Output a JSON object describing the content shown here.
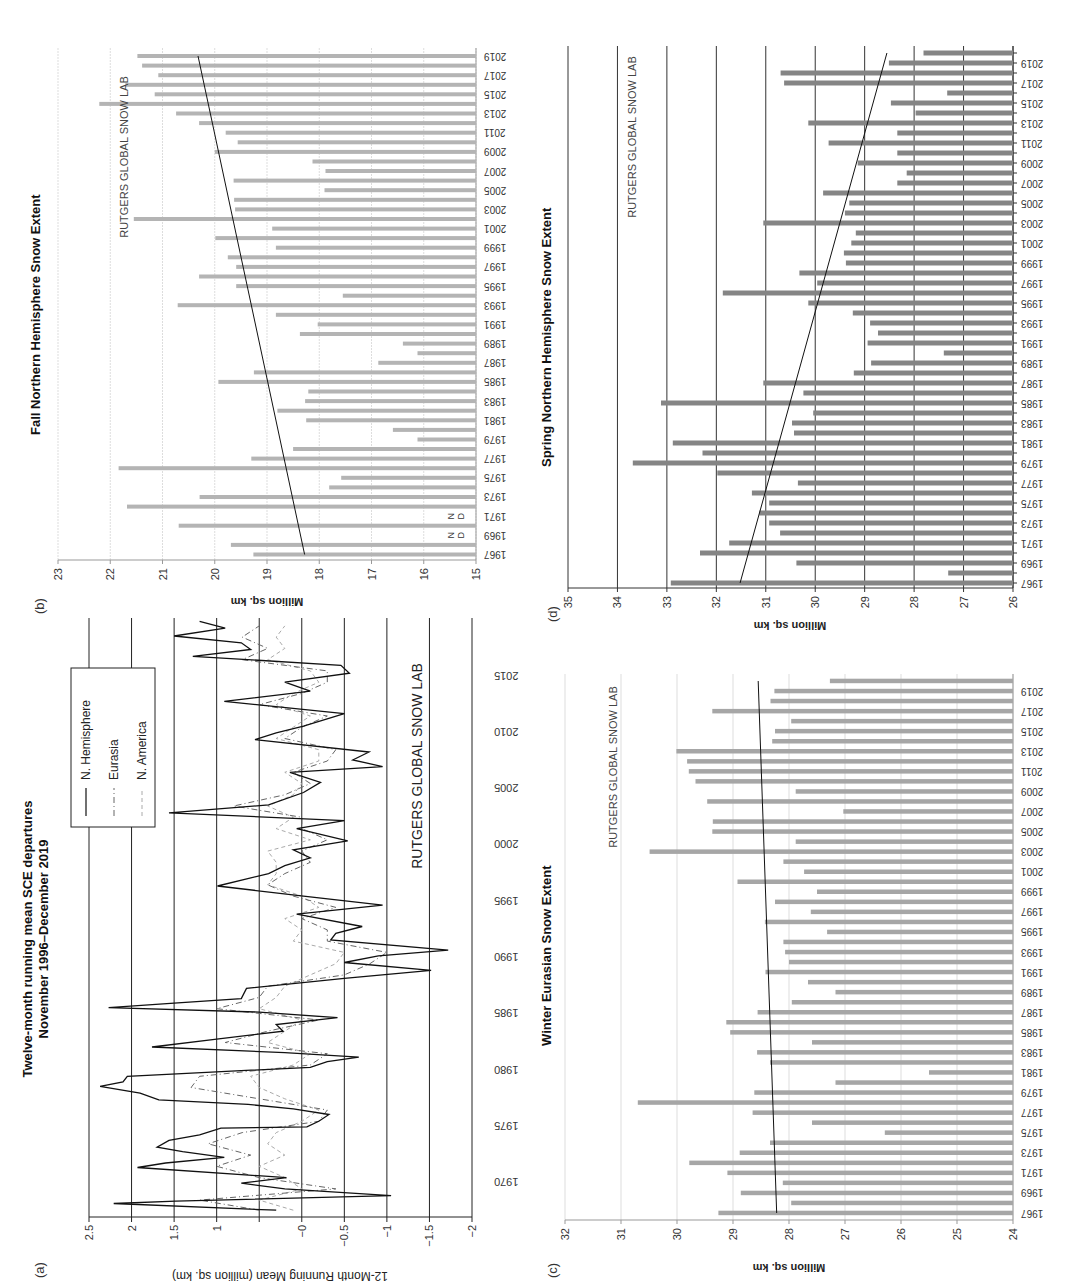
{
  "figure": {
    "panel_labels": {
      "a": "(a)",
      "b": "(b)",
      "c": "(c)",
      "d": "(d)"
    },
    "watermark": "RUTGERS GLOBAL SNOW LAB",
    "colors": {
      "fall_bar": "#b4b4b4",
      "spring_bar": "#858585",
      "winter_bar": "#a6a6a6",
      "grid_light": "#dddddd",
      "grid_dark": "#333333",
      "nh_line": "#111111",
      "eurasia_line": "#666666",
      "namerica_line": "#aaaaaa"
    }
  },
  "chart_data": [
    {
      "id": "a",
      "type": "line",
      "title": "Twelve-month running mean SCE departures",
      "subtitle": "November 1996–December 2019",
      "xlabel": "",
      "ylabel": "12-Month Running Mean (million sq. km)",
      "ylim": [
        -2,
        2.5
      ],
      "xlim": [
        1967,
        2020
      ],
      "yticks": [
        2.5,
        2,
        1.5,
        1,
        0.5,
        0,
        -0.5,
        -1,
        -1.5,
        -2
      ],
      "ytick_labels": [
        "2.5",
        "2",
        "1.5",
        "1",
        "",
        "−0",
        "−0.5",
        "−1",
        "−1.5",
        "−2"
      ],
      "xticks": [
        1970,
        1975,
        1980,
        1985,
        1990,
        1995,
        2000,
        2005,
        2010,
        2015
      ],
      "xtick_labels": [
        "1970",
        "1975",
        "1980",
        "1985",
        "1990",
        "1995",
        "2000",
        "2005",
        "2010",
        "2015"
      ],
      "grid": true,
      "legend": [
        "N. Hemisphere",
        "Eurasia",
        "N. America"
      ],
      "legend_position": "upper right",
      "annotation": "RUTGERS GLOBAL SNOW LAB",
      "series": [
        {
          "name": "N. Hemisphere",
          "style": "solid",
          "x": [
            1967.6,
            1968.2,
            1968.4,
            1968.9,
            1969.5,
            1970.0,
            1970.5,
            1971.4,
            1971.8,
            1972.3,
            1972.8,
            1973.2,
            1973.8,
            1974.3,
            1974.9,
            1975.0,
            1975.5,
            1976.1,
            1976.6,
            1977.0,
            1977.4,
            1978.0,
            1978.6,
            1979.0,
            1979.5,
            1980.3,
            1980.8,
            1981.2,
            1981.6,
            1982.1,
            1982.8,
            1983.5,
            1984.1,
            1984.7,
            1985.2,
            1985.6,
            1986.0,
            1986.4,
            1987.3,
            1988.2,
            1988.9,
            1989.6,
            1990.2,
            1990.7,
            1991.6,
            1992.2,
            1992.8,
            1993.9,
            1994.7,
            1995.5,
            1996.4,
            1997.5,
            1998.2,
            1998.9,
            1999.6,
            2000.4,
            2001.5,
            2002.2,
            2002.9,
            2003.6,
            2004.7,
            2005.6,
            2006.5,
            2007.0,
            2007.6,
            2008.3,
            2009.4,
            2010.0,
            2010.6,
            2011.7,
            2012.8,
            2013.7,
            2014.5,
            2015.3,
            2016.0,
            2016.8,
            2017.4,
            2018.0,
            2018.6,
            2019.3,
            2019.9
          ],
          "y": [
            0.3,
            2.21,
            1.48,
            -1.05,
            0.2,
            0.71,
            0.18,
            1.93,
            1.6,
            0.91,
            1.4,
            1.7,
            1.56,
            1.2,
            0.95,
            -0.06,
            -0.2,
            -0.32,
            0.1,
            0.63,
            1.68,
            1.9,
            2.37,
            2.1,
            2.05,
            -0.1,
            -0.3,
            -0.67,
            0.2,
            1.76,
            1.0,
            0.22,
            0.3,
            -0.42,
            0.5,
            2.27,
            1.5,
            0.71,
            0.65,
            -0.5,
            -1.52,
            -0.5,
            -0.9,
            -1.72,
            -0.34,
            -0.4,
            -0.71,
            0.06,
            -0.95,
            -0.02,
            0.99,
            0.39,
            0.2,
            -0.1,
            0.1,
            -0.54,
            0.06,
            -0.5,
            1.56,
            0.39,
            -0.02,
            -0.22,
            0.14,
            -0.95,
            -0.6,
            -0.79,
            0.55,
            0.3,
            -0.02,
            -0.5,
            0.91,
            -0.1,
            0.2,
            -0.56,
            -0.46,
            1.28,
            0.6,
            0.71,
            1.5,
            0.9,
            1.2
          ]
        },
        {
          "name": "Eurasia",
          "style": "dash-dot",
          "x": [
            1967.6,
            1968.5,
            1969.5,
            1970.5,
            1971.5,
            1972.5,
            1973.5,
            1974.5,
            1975.5,
            1976.5,
            1977.5,
            1978.5,
            1979.5,
            1980.5,
            1981.5,
            1982.5,
            1983.5,
            1984.5,
            1985.5,
            1986.5,
            1987.5,
            1988.5,
            1989.5,
            1990.5,
            1991.5,
            1992.5,
            1993.5,
            1994.5,
            1995.5,
            1996.5,
            1997.5,
            1998.5,
            1999.5,
            2000.5,
            2001.5,
            2002.5,
            2003.5,
            2004.5,
            2005.5,
            2006.5,
            2007.5,
            2008.5,
            2009.5,
            2010.5,
            2011.5,
            2012.5,
            2013.5,
            2014.5,
            2015.5,
            2016.5,
            2017.5,
            2018.5,
            2019.5
          ],
          "y": [
            0.5,
            1.2,
            -0.4,
            0.5,
            1.0,
            0.6,
            1.1,
            0.7,
            -0.2,
            -0.3,
            0.5,
            1.3,
            1.2,
            -0.1,
            -0.3,
            0.9,
            0.4,
            -0.2,
            1.0,
            0.5,
            0.4,
            -0.5,
            -0.8,
            -1.0,
            -0.3,
            -0.3,
            0.0,
            -0.4,
            0.1,
            0.4,
            0.2,
            -0.1,
            0.0,
            -0.3,
            0.0,
            0.0,
            0.8,
            0.2,
            -0.1,
            0.1,
            -0.3,
            -0.4,
            0.2,
            0.0,
            -0.3,
            0.5,
            0.0,
            -0.3,
            -0.3,
            0.7,
            0.4,
            0.7,
            0.5
          ]
        },
        {
          "name": "N. America",
          "style": "dashed",
          "x": [
            1967.6,
            1968.5,
            1969.5,
            1970.5,
            1971.5,
            1972.5,
            1973.5,
            1974.5,
            1975.5,
            1976.5,
            1977.5,
            1978.5,
            1979.5,
            1980.5,
            1981.5,
            1982.5,
            1983.5,
            1984.5,
            1985.5,
            1986.5,
            1987.5,
            1988.5,
            1989.5,
            1990.5,
            1991.5,
            1992.5,
            1993.5,
            1994.5,
            1995.5,
            1996.5,
            1997.5,
            1998.5,
            1999.5,
            2000.5,
            2001.5,
            2002.5,
            2003.5,
            2004.5,
            2005.5,
            2006.5,
            2007.5,
            2008.5,
            2009.5,
            2010.5,
            2011.5,
            2012.5,
            2013.5,
            2014.5,
            2015.5,
            2016.5,
            2017.5,
            2018.5,
            2019.5
          ],
          "y": [
            0.1,
            0.5,
            0.0,
            0.2,
            0.5,
            0.2,
            0.4,
            0.3,
            0.0,
            -0.2,
            0.2,
            0.5,
            0.6,
            0.1,
            -0.1,
            0.4,
            0.2,
            0.0,
            0.5,
            0.3,
            0.2,
            -0.1,
            -0.4,
            -0.5,
            0.1,
            0.0,
            0.2,
            -0.2,
            0.0,
            0.4,
            0.3,
            0.3,
            0.4,
            -0.1,
            0.3,
            0.1,
            0.4,
            0.1,
            0.0,
            0.2,
            -0.2,
            -0.2,
            0.3,
            0.1,
            -0.1,
            0.3,
            0.1,
            -0.2,
            -0.1,
            0.4,
            0.2,
            0.3,
            0.2
          ]
        }
      ]
    },
    {
      "id": "b",
      "type": "bar",
      "title": "Fall Northern Hemisphere Snow Extent",
      "xlabel": "",
      "ylabel": "Million sq. km",
      "ylim": [
        15,
        23
      ],
      "yticks": [
        23,
        22,
        21,
        20,
        19,
        18,
        17,
        16,
        15
      ],
      "grid": true,
      "annotation": "RUTGERS GLOBAL SNOW LAB",
      "missing_label": [
        "N",
        "D"
      ],
      "missing_years": [
        1969,
        1971
      ],
      "categories": [
        1967,
        1968,
        1969,
        1970,
        1971,
        1972,
        1973,
        1974,
        1975,
        1976,
        1977,
        1978,
        1979,
        1980,
        1981,
        1982,
        1983,
        1984,
        1985,
        1986,
        1987,
        1988,
        1989,
        1990,
        1991,
        1992,
        1993,
        1994,
        1995,
        1996,
        1997,
        1998,
        1999,
        2000,
        2001,
        2002,
        2003,
        2004,
        2005,
        2006,
        2007,
        2008,
        2009,
        2010,
        2011,
        2012,
        2013,
        2014,
        2015,
        2016,
        2017,
        2018,
        2019
      ],
      "xtick_labels": [
        "1967",
        "1969",
        "1971",
        "1973",
        "1975",
        "1977",
        "1979",
        "1981",
        "1983",
        "1985",
        "1987",
        "1989",
        "1991",
        "1993",
        "1995",
        "1997",
        "1999",
        "2001",
        "2003",
        "2005",
        "2007",
        "2009",
        "2011",
        "2013",
        "2015",
        "2017",
        "2019"
      ],
      "values": [
        19.26,
        19.69,
        null,
        20.69,
        null,
        21.68,
        20.29,
        17.81,
        17.58,
        21.84,
        19.3,
        18.5,
        16.12,
        16.59,
        18.25,
        18.8,
        18.27,
        18.21,
        19.93,
        19.25,
        16.87,
        16.12,
        16.4,
        18.37,
        18.03,
        18.83,
        20.71,
        17.55,
        19.59,
        20.3,
        19.59,
        19.75,
        18.83,
        19.99,
        18.9,
        21.55,
        19.61,
        19.63,
        17.9,
        19.64,
        17.88,
        18.13,
        20.0,
        19.56,
        19.79,
        20.3,
        20.74,
        22.21,
        21.15,
        21.71,
        21.08,
        21.39,
        21.48
      ],
      "trend": {
        "start": [
          1967,
          18.28
        ],
        "end": [
          2019,
          20.32
        ]
      }
    },
    {
      "id": "c",
      "type": "bar",
      "title": "Winter Eurasian Snow Extent",
      "xlabel": "",
      "ylabel": "Million sq. km",
      "ylim": [
        24,
        32
      ],
      "yticks": [
        32,
        31,
        30,
        29,
        28,
        27,
        26,
        25,
        24
      ],
      "grid": true,
      "annotation": "RUTGERS GLOBAL SNOW LAB",
      "categories": [
        1967,
        1968,
        1969,
        1970,
        1971,
        1972,
        1973,
        1974,
        1975,
        1976,
        1977,
        1978,
        1979,
        1980,
        1981,
        1982,
        1983,
        1984,
        1985,
        1986,
        1987,
        1988,
        1989,
        1990,
        1991,
        1992,
        1993,
        1994,
        1995,
        1996,
        1997,
        1998,
        1999,
        2000,
        2001,
        2002,
        2003,
        2004,
        2005,
        2006,
        2007,
        2008,
        2009,
        2010,
        2011,
        2012,
        2013,
        2014,
        2015,
        2016,
        2017,
        2018,
        2019,
        2020
      ],
      "xtick_labels": [
        "1967",
        "1969",
        "1971",
        "1973",
        "1975",
        "1977",
        "1979",
        "1981",
        "1983",
        "1985",
        "1987",
        "1989",
        "1991",
        "1993",
        "1995",
        "1997",
        "1999",
        "2001",
        "2003",
        "2005",
        "2007",
        "2009",
        "2011",
        "2013",
        "2015",
        "2017",
        "2019"
      ],
      "values": [
        29.26,
        27.96,
        28.86,
        28.11,
        29.1,
        29.78,
        28.88,
        28.34,
        26.29,
        27.59,
        28.65,
        30.7,
        28.62,
        27.17,
        25.5,
        28.34,
        28.57,
        27.59,
        29.05,
        29.12,
        28.56,
        27.95,
        27.17,
        27.66,
        28.42,
        28.0,
        28.07,
        28.1,
        27.32,
        28.43,
        27.61,
        28.25,
        27.5,
        28.92,
        27.73,
        28.1,
        30.49,
        27.88,
        29.37,
        29.36,
        27.03,
        29.46,
        27.88,
        29.67,
        29.79,
        29.82,
        30.01,
        28.3,
        28.25,
        27.96,
        29.37,
        28.33,
        28.26,
        27.27
      ],
      "trend": {
        "start": [
          1967,
          28.22
        ],
        "end": [
          2020,
          28.55
        ]
      }
    },
    {
      "id": "d",
      "type": "bar",
      "title": "Spring Northern Hemisphere Snow Extent",
      "xlabel": "",
      "ylabel": "Million sq. km",
      "ylim": [
        26,
        35
      ],
      "yticks": [
        35,
        34,
        33,
        32,
        31,
        30,
        29,
        28,
        27,
        26
      ],
      "grid": true,
      "annotation": "RUTGERS GLOBAL SNOW LAB",
      "categories": [
        1967,
        1968,
        1969,
        1970,
        1971,
        1972,
        1973,
        1974,
        1975,
        1976,
        1977,
        1978,
        1979,
        1980,
        1981,
        1982,
        1983,
        1984,
        1985,
        1986,
        1987,
        1988,
        1989,
        1990,
        1991,
        1992,
        1993,
        1994,
        1995,
        1996,
        1997,
        1998,
        1999,
        2000,
        2001,
        2002,
        2003,
        2004,
        2005,
        2006,
        2007,
        2008,
        2009,
        2010,
        2011,
        2012,
        2013,
        2014,
        2015,
        2016,
        2017,
        2018,
        2019,
        2020
      ],
      "xtick_labels": [
        "1967",
        "1969",
        "1971",
        "1973",
        "1975",
        "1977",
        "1979",
        "1981",
        "1983",
        "1985",
        "1987",
        "1989",
        "1991",
        "1993",
        "1995",
        "1997",
        "1999",
        "2001",
        "2003",
        "2005",
        "2007",
        "2009",
        "2011",
        "2013",
        "2015",
        "2017",
        "2019"
      ],
      "values": [
        32.92,
        27.31,
        30.38,
        32.33,
        31.74,
        30.71,
        30.93,
        31.13,
        30.93,
        31.28,
        30.35,
        31.98,
        33.69,
        32.28,
        32.88,
        30.43,
        30.47,
        30.04,
        33.12,
        30.24,
        31.05,
        29.22,
        28.87,
        27.4,
        28.94,
        28.73,
        28.89,
        29.24,
        30.14,
        31.87,
        29.96,
        30.32,
        29.38,
        29.42,
        29.27,
        29.18,
        31.05,
        29.4,
        29.31,
        29.84,
        28.34,
        28.15,
        29.14,
        28.34,
        29.73,
        28.34,
        30.14,
        27.97,
        28.47,
        27.33,
        30.63,
        30.7,
        28.51,
        27.81
      ],
      "trend": {
        "start": [
          1967,
          31.52
        ],
        "end": [
          2020,
          28.55
        ]
      }
    }
  ]
}
